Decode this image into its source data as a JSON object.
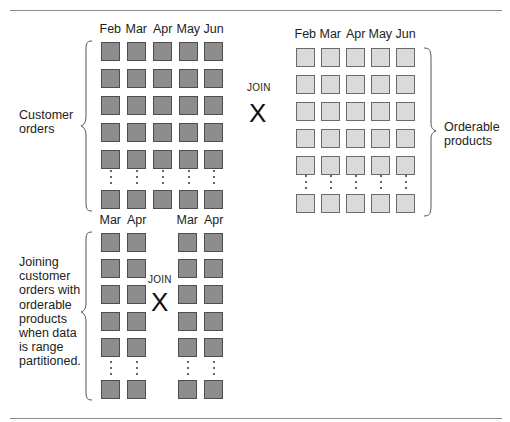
{
  "diagram": {
    "top_left": {
      "months": [
        "Feb",
        "Mar",
        "Apr",
        "May",
        "Jun"
      ],
      "label_lines": [
        "Customer",
        "orders"
      ],
      "shade": "dark",
      "visible_rows_before_ellipsis": 5
    },
    "top_join": {
      "label": "JOIN",
      "symbol": "X"
    },
    "top_right": {
      "months": [
        "Feb",
        "Mar",
        "Apr",
        "May",
        "Jun"
      ],
      "label_lines": [
        "Orderable",
        "products"
      ],
      "shade": "light",
      "visible_rows_before_ellipsis": 5
    },
    "bottom": {
      "left_months": [
        "Mar",
        "Apr"
      ],
      "right_months": [
        "Mar",
        "Apr"
      ],
      "label_lines": [
        "Joining",
        "customer",
        "orders with",
        "orderable",
        "products",
        "when data",
        "is range",
        "partitioned."
      ],
      "join": {
        "label": "JOIN",
        "symbol": "X"
      },
      "shade": "dark",
      "visible_rows_before_ellipsis": 5
    },
    "colors": {
      "dark_fill": "#8d8d8d",
      "dark_border": "#4e4e4e",
      "light_fill": "#dadada",
      "light_border": "#6a6a6a",
      "rule": "#8a8a8a"
    }
  }
}
